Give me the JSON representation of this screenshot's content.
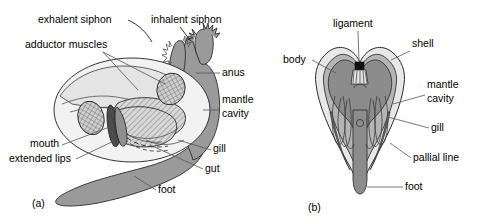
{
  "figure": {
    "background_color": "#ffffff"
  },
  "colors": {
    "body_gray": "#9a9a9a",
    "dark_gray": "#8c8c8c",
    "mid_gray": "#b5b5b5",
    "light_gray": "#dcdcdc",
    "pale_gray": "#ededed",
    "shell_light": "#e8e8e8",
    "outline": "#2b2b2b",
    "leader": "#555555",
    "text": "#000000",
    "ligament_black": "#111111"
  },
  "panels": [
    {
      "id": "a",
      "id_label": "(a)",
      "caption": "lateral view with left shell valve and mantle removed",
      "labels": [
        {
          "name": "exhalent-siphon",
          "text": "exhalent siphon",
          "x": 38,
          "y": 23,
          "anchor": "start"
        },
        {
          "name": "inhalent-siphon",
          "text": "inhalent siphon",
          "x": 151,
          "y": 23,
          "anchor": "start"
        },
        {
          "name": "adductor-muscles",
          "text": "adductor muscles",
          "x": 25,
          "y": 48,
          "anchor": "start"
        },
        {
          "name": "anus",
          "text": "anus",
          "x": 222,
          "y": 76,
          "anchor": "start"
        },
        {
          "name": "mantle-cavity-line1",
          "text": "mantle",
          "x": 222,
          "y": 103,
          "anchor": "start"
        },
        {
          "name": "mantle-cavity-line2",
          "text": "cavity",
          "x": 222,
          "y": 117,
          "anchor": "start"
        },
        {
          "name": "mouth",
          "text": "mouth",
          "x": 30,
          "y": 147,
          "anchor": "start"
        },
        {
          "name": "extended-lips",
          "text": "extended lips",
          "x": 9,
          "y": 162,
          "anchor": "start"
        },
        {
          "name": "gill",
          "text": "gill",
          "x": 213,
          "y": 152,
          "anchor": "start"
        },
        {
          "name": "gut",
          "text": "gut",
          "x": 205,
          "y": 172,
          "anchor": "start"
        },
        {
          "name": "foot",
          "text": "foot",
          "x": 158,
          "y": 193,
          "anchor": "start"
        }
      ]
    },
    {
      "id": "b",
      "id_label": "(b)",
      "caption": "transverse section through the body",
      "labels": [
        {
          "name": "ligament",
          "text": "ligament",
          "x": 333,
          "y": 27,
          "anchor": "start"
        },
        {
          "name": "shell",
          "text": "shell",
          "x": 412,
          "y": 47,
          "anchor": "start"
        },
        {
          "name": "body",
          "text": "body",
          "x": 283,
          "y": 63,
          "anchor": "start"
        },
        {
          "name": "mantle-cavity-line1",
          "text": "mantle",
          "x": 427,
          "y": 88,
          "anchor": "start"
        },
        {
          "name": "mantle-cavity-line2",
          "text": "cavity",
          "x": 427,
          "y": 102,
          "anchor": "start"
        },
        {
          "name": "gill",
          "text": "gill",
          "x": 431,
          "y": 131,
          "anchor": "start"
        },
        {
          "name": "pallial-line",
          "text": "pallial line",
          "x": 413,
          "y": 161,
          "anchor": "start"
        },
        {
          "name": "foot",
          "text": "foot",
          "x": 405,
          "y": 190,
          "anchor": "start"
        }
      ]
    }
  ]
}
